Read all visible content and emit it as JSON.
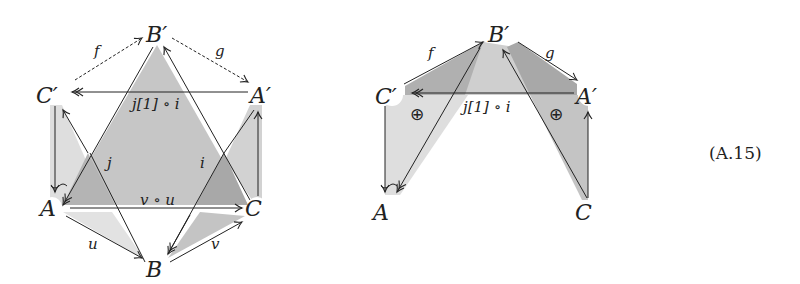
{
  "diagram_left": {
    "nodes": {
      "B_prime": "B′",
      "C_prime": "C′",
      "A_prime": "A′",
      "A": "A",
      "C": "C",
      "B": "B"
    },
    "edges": {
      "f": "f",
      "g": "g",
      "top_horizontal": "j[1] ∘ i",
      "j": "j",
      "i": "i",
      "bottom_horizontal": "v ∘ u",
      "u": "u",
      "v": "v"
    }
  },
  "diagram_right": {
    "nodes": {
      "B_prime": "B′",
      "C_prime": "C′",
      "A_prime": "A′",
      "A": "A",
      "C": "C"
    },
    "edges": {
      "f": "f",
      "g": "g",
      "top_horizontal": "j[1] ∘ i"
    },
    "marks": {
      "left_oplus": "⊕",
      "right_oplus": "⊕"
    }
  },
  "equation_label": "(A.15)",
  "colors": {
    "light_gray": "#dcdcdc",
    "mid_gray": "#c4c4c4",
    "dark_gray": "#a9a9a9",
    "stroke": "#222222"
  }
}
